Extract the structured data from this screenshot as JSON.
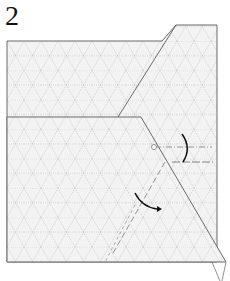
{
  "step_number": "2",
  "diagram": {
    "colors": {
      "paper": "#f2f2f2",
      "outline": "#666666",
      "grid": "#b8b8b8",
      "arrow": "#111111",
      "fold_line": "#888888"
    },
    "arrows": [
      {
        "name": "mountain-fold-arrow",
        "direction": "curve-down"
      },
      {
        "name": "valley-fold-arrow",
        "direction": "curve-right"
      }
    ]
  }
}
